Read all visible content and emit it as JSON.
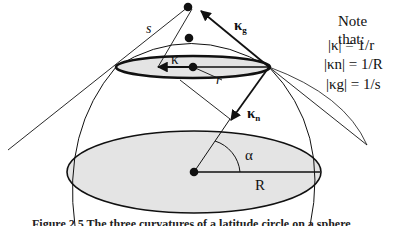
{
  "figure": {
    "labels": {
      "s": "s",
      "kappa": "κ",
      "kappa_g": "κ",
      "kappa_g_sub": "g",
      "kappa_n": "κ",
      "kappa_n_sub": "n",
      "r": "r",
      "R": "R",
      "alpha": "α"
    },
    "note": {
      "title": "Note that:",
      "lines": [
        "|κ| = 1/r",
        "|κn| = 1/R",
        "|κg| = 1/s"
      ]
    },
    "colors": {
      "stroke": "#111111",
      "fill": "#e4e4e4"
    },
    "caption": "Figure 2.5  The three curvatures of a latitude circle on a sphere"
  }
}
